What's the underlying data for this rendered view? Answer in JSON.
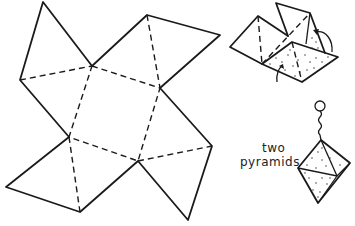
{
  "figure": {
    "net": {
      "square": [
        [
          92,
          66
        ],
        [
          160,
          88
        ],
        [
          138,
          161
        ],
        [
          69,
          137
        ]
      ],
      "triangles": [
        {
          "base": [
            [
              20,
              80
            ],
            [
              92,
              66
            ]
          ],
          "apex": [
            43,
            2
          ],
          "note": "top-left flap"
        },
        {
          "base": [
            [
              92,
              66
            ],
            [
              160,
              88
            ]
          ],
          "apex": [
            147,
            15
          ],
          "far": [
            220,
            35
          ],
          "note": "top-right flap"
        },
        {
          "base": [
            [
              69,
              137
            ],
            [
              138,
              161
            ]
          ],
          "apex": [
            80,
            212
          ],
          "far": [
            6,
            187
          ],
          "note": "bottom-left flap"
        },
        {
          "base": [
            [
              138,
              161
            ],
            [
              212,
              146
            ]
          ],
          "apex": [
            188,
            220
          ],
          "note": "bottom-right flap"
        }
      ]
    },
    "labels": {
      "line1": "two",
      "line2": "pyramids"
    },
    "colors": {
      "ink": "#1a1a1a",
      "paper": "#ffffff"
    }
  }
}
